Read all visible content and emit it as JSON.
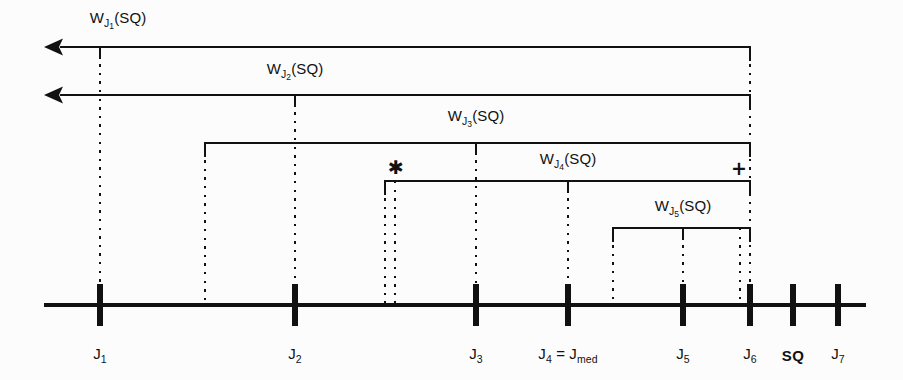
{
  "figure": {
    "type": "timeline-bracket-diagram",
    "background_color": "#fcfcfc",
    "line_color": "#111111",
    "axis": {
      "y": 305,
      "x_start": 44,
      "x_end": 866,
      "label_y": 355,
      "ticks": [
        {
          "id": "J1",
          "x": 100,
          "label_main": "J",
          "label_sub": "1",
          "bold": false
        },
        {
          "id": "J2",
          "x": 295,
          "label_main": "J",
          "label_sub": "2",
          "bold": false
        },
        {
          "id": "J3",
          "x": 476,
          "label_main": "J",
          "label_sub": "3",
          "bold": false
        },
        {
          "id": "J4",
          "x": 568,
          "label_main": "J",
          "label_sub": "4",
          "bold": false,
          "label_extra": " = J",
          "label_extra_sub": "med"
        },
        {
          "id": "J5",
          "x": 683,
          "label_main": "J",
          "label_sub": "5",
          "bold": false
        },
        {
          "id": "J6",
          "x": 750,
          "label_main": "J",
          "label_sub": "6",
          "bold": false
        },
        {
          "id": "SQ",
          "x": 793,
          "label_main": "SQ",
          "label_sub": "",
          "bold": true
        },
        {
          "id": "J7",
          "x": 838,
          "label_main": "J",
          "label_sub": "7",
          "bold": false
        }
      ]
    },
    "windows": [
      {
        "id": "WJ1",
        "label_main": "W",
        "label_sub": "J",
        "label_sub_idx": "1",
        "label_tail": "(SQ)",
        "label_x": 118,
        "label_y": 20,
        "y": 47,
        "left_x": 44,
        "right_x": 750,
        "left_cap": "arrow",
        "right_cap": "bracket",
        "tick_x": 100
      },
      {
        "id": "WJ2",
        "label_main": "W",
        "label_sub": "J",
        "label_sub_idx": "2",
        "label_tail": "(SQ)",
        "label_x": 295,
        "label_y": 71,
        "y": 95,
        "left_x": 44,
        "right_x": 750,
        "left_cap": "arrow",
        "right_cap": "bracket",
        "tick_x": 295
      },
      {
        "id": "WJ3",
        "label_main": "W",
        "label_sub": "J",
        "label_sub_idx": "3",
        "label_tail": "(SQ)",
        "label_x": 476,
        "label_y": 118,
        "y": 143,
        "left_x": 205,
        "right_x": 750,
        "left_cap": "bracket",
        "right_cap": "bracket",
        "tick_x": 476
      },
      {
        "id": "WJ4",
        "label_main": "W",
        "label_sub": "J",
        "label_sub_idx": "4",
        "label_tail": "(SQ)",
        "label_x": 568,
        "label_y": 161,
        "y": 181,
        "left_x": 385,
        "right_x": 750,
        "left_cap": "bracket",
        "right_cap": "bracket",
        "tick_x": 568
      },
      {
        "id": "WJ5",
        "label_main": "W",
        "label_sub": "J",
        "label_sub_idx": "5",
        "label_tail": "(SQ)",
        "label_x": 683,
        "label_y": 208,
        "y": 228,
        "left_x": 613,
        "right_x": 750,
        "left_cap": "bracket",
        "right_cap": "bracket",
        "tick_x": 683
      }
    ],
    "dotted_verticals": [
      {
        "x": 100,
        "y_top": 47,
        "y_bottom": 305
      },
      {
        "x": 295,
        "y_top": 95,
        "y_bottom": 305
      },
      {
        "x": 205,
        "y_top": 143,
        "y_bottom": 305
      },
      {
        "x": 476,
        "y_top": 143,
        "y_bottom": 305
      },
      {
        "x": 385,
        "y_top": 181,
        "y_bottom": 305
      },
      {
        "x": 395,
        "y_top": 181,
        "y_bottom": 305
      },
      {
        "x": 568,
        "y_top": 181,
        "y_bottom": 305
      },
      {
        "x": 613,
        "y_top": 228,
        "y_bottom": 305
      },
      {
        "x": 683,
        "y_top": 228,
        "y_bottom": 305
      },
      {
        "x": 740,
        "y_top": 228,
        "y_bottom": 305
      },
      {
        "x": 750,
        "y_top": 47,
        "y_bottom": 305
      }
    ],
    "annotations": [
      {
        "id": "asterisk",
        "symbol": "✱",
        "x": 396,
        "y": 167
      },
      {
        "id": "plus",
        "symbol": "+",
        "x": 739,
        "y": 168
      }
    ]
  }
}
